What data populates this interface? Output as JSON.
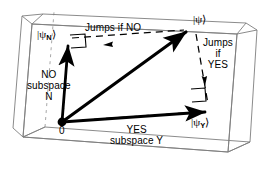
{
  "figure": {
    "colors": {
      "ink": "#000000",
      "box_line": "#7b7b7b",
      "background": "#ffffff"
    }
  },
  "labels": {
    "psi": "|ψ⟩",
    "psi_n_ket_open": "|ψ",
    "psi_n_sub": "N",
    "psi_n_ket_close": "⟩",
    "psi_y_ket_open": "|ψ",
    "psi_y_sub": "Y",
    "psi_y_ket_close": "⟩",
    "origin": "0",
    "jumps_if_no": "Jumps if",
    "jumps_if_no_bold": "NO",
    "jumps_line1": "Jumps",
    "jumps_line2": "if",
    "jumps_line3_bold": "YES",
    "no_subspace_line1": "NO",
    "no_subspace_line2": "subspace",
    "no_subspace_line3": "N",
    "yes_subspace_line1": "YES",
    "yes_subspace_line2": "subspace",
    "yes_subspace_line2b": "Y"
  },
  "geometry": {
    "origin": [
      62,
      122
    ],
    "psi_tip": [
      190,
      29
    ],
    "psi_n_tip": [
      67,
      41
    ],
    "psi_y_tip": [
      212,
      112
    ],
    "vector_names": [
      "state-vector-psi",
      "projection-vector-psi-n",
      "projection-vector-psi-y"
    ]
  }
}
